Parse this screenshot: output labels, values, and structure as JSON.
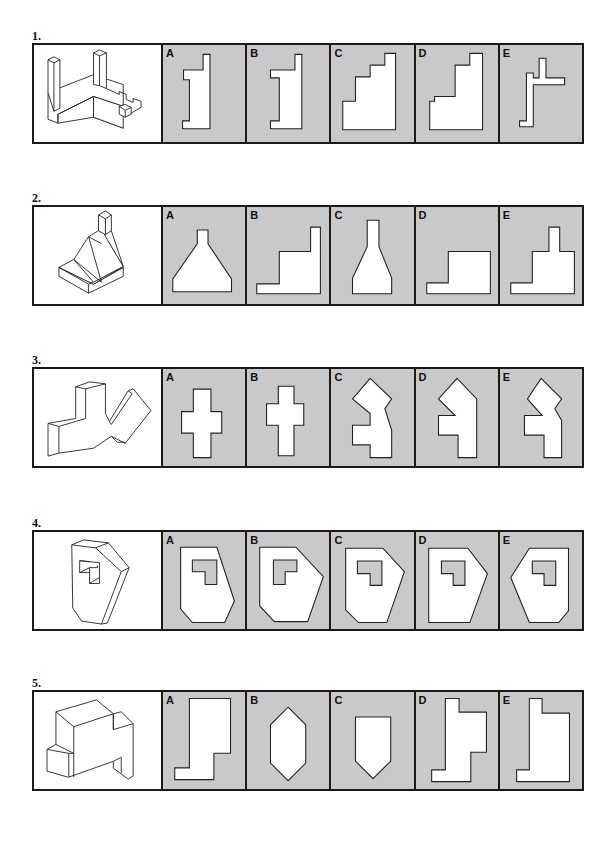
{
  "questions": [
    {
      "number": "1.",
      "options": [
        {
          "letter": "A"
        },
        {
          "letter": "B"
        },
        {
          "letter": "C"
        },
        {
          "letter": "D"
        },
        {
          "letter": "E"
        }
      ],
      "figure": "isometric-frame-with-posts"
    },
    {
      "number": "2.",
      "options": [
        {
          "letter": "A"
        },
        {
          "letter": "B"
        },
        {
          "letter": "C"
        },
        {
          "letter": "D"
        },
        {
          "letter": "E"
        }
      ],
      "figure": "isometric-sloped-block-with-chimney"
    },
    {
      "number": "3.",
      "options": [
        {
          "letter": "A"
        },
        {
          "letter": "B"
        },
        {
          "letter": "C"
        },
        {
          "letter": "D"
        },
        {
          "letter": "E"
        }
      ],
      "figure": "isometric-zigzag-slab"
    },
    {
      "number": "4.",
      "options": [
        {
          "letter": "A"
        },
        {
          "letter": "B"
        },
        {
          "letter": "C"
        },
        {
          "letter": "D"
        },
        {
          "letter": "E"
        }
      ],
      "figure": "isometric-hexagonal-block-with-l-cutout"
    },
    {
      "number": "5.",
      "options": [
        {
          "letter": "A"
        },
        {
          "letter": "B"
        },
        {
          "letter": "C"
        },
        {
          "letter": "D"
        },
        {
          "letter": "E"
        }
      ],
      "figure": "isometric-notched-block"
    }
  ],
  "colors": {
    "option_bg": "#c9c9c9",
    "figure_fill": "#ffffff",
    "outline": "#1a1a1a"
  }
}
